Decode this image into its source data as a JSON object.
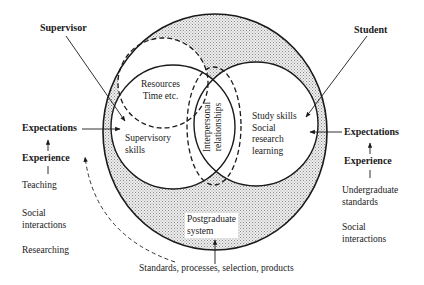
{
  "diagram": {
    "colors": {
      "stroke": "#1a1a1a",
      "ring_fill": "#d9d9d9",
      "background": "#ffffff"
    },
    "actors": {
      "supervisor": "Supervisor",
      "student": "Student"
    },
    "inner": {
      "resources": "Resources\nTime etc.",
      "supervisory_skills": "Supervisory\nskills",
      "interpersonal": "Interpersonal\nrelationships",
      "student_skills": "Study skills\nSocial\nresearch\nlearning",
      "postgraduate_system": "Postgraduate\nsystem"
    },
    "left_side": {
      "expectations": "Expectations",
      "experience": "Experience",
      "items": [
        "Teaching",
        "Social\ninteractions",
        "Researching"
      ]
    },
    "right_side": {
      "expectations": "Expectations",
      "experience": "Experience",
      "items": [
        "Undergraduate\nstandards",
        "Social\ninteractions"
      ]
    },
    "bottom_label": "Standards, processes, selection, products"
  }
}
